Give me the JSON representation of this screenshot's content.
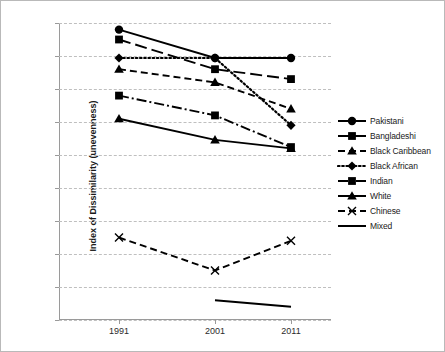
{
  "chart_data": {
    "type": "line",
    "title": "",
    "xlabel": "",
    "ylabel": "Index of Dissimilarity (unevenness)",
    "x": [
      1991,
      2001,
      2011
    ],
    "categories": [
      "1991",
      "2001",
      "2011"
    ],
    "ylim": [
      30,
      75
    ],
    "yticks": [
      30,
      35,
      40,
      45,
      50,
      55,
      60,
      65,
      70,
      75
    ],
    "ytick_labels": [
      "30",
      "35",
      "40",
      "45",
      "50",
      "55",
      "60",
      "65",
      "70",
      "75"
    ],
    "grid": true,
    "legend_position": "right",
    "series": [
      {
        "name": "Pakistani",
        "values": [
          74.0,
          69.7,
          69.7
        ],
        "marker": "circle",
        "line": "solid"
      },
      {
        "name": "Bangladeshi",
        "values": [
          72.5,
          68.0,
          66.5
        ],
        "marker": "square",
        "line": "long-dash"
      },
      {
        "name": "Black Caribbean",
        "values": [
          68.0,
          66.0,
          62.0
        ],
        "marker": "triangle",
        "line": "dash"
      },
      {
        "name": "Black African",
        "values": [
          69.7,
          69.7,
          59.5
        ],
        "marker": "diamond",
        "line": "dot"
      },
      {
        "name": "Indian",
        "values": [
          64.0,
          61.0,
          56.2
        ],
        "marker": "square",
        "line": "dash-dot"
      },
      {
        "name": "White",
        "values": [
          60.5,
          57.3,
          56.0
        ],
        "marker": "triangle",
        "line": "solid"
      },
      {
        "name": "Chinese",
        "values": [
          42.5,
          37.5,
          42.0
        ],
        "marker": "cross",
        "line": "dash"
      },
      {
        "name": "Mixed",
        "values": [
          null,
          33.0,
          32.0
        ],
        "marker": "none",
        "line": "solid"
      }
    ]
  },
  "legend": {
    "items": [
      {
        "label": "Pakistani"
      },
      {
        "label": "Bangladeshi"
      },
      {
        "label": "Black Caribbean"
      },
      {
        "label": "Black African"
      },
      {
        "label": "Indian"
      },
      {
        "label": "White"
      },
      {
        "label": "Chinese"
      },
      {
        "label": "Mixed"
      }
    ]
  },
  "colors": {
    "series": "#000000",
    "grid": "#bfbfbf",
    "axis": "#9a9a9a",
    "border": "#b9b9b9",
    "text": "#1a1a1a",
    "background": "#ffffff"
  }
}
